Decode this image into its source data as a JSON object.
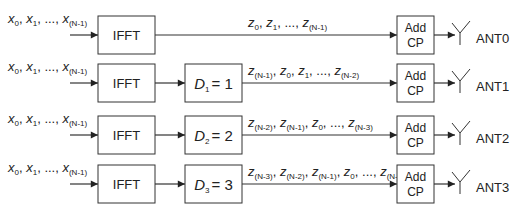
{
  "colors": {
    "line": "#333333",
    "box_fill": "#ffffff",
    "text": "#222222"
  },
  "rows": [
    {
      "input_label": "x0, x1, ..., x(N-1)",
      "ifft_label": "IFFT",
      "delay_label": null,
      "output_label": "z0, z1, ..., z(N-1)",
      "addcp_label_1": "Add",
      "addcp_label_2": "CP",
      "antenna_label": "ANT0"
    },
    {
      "input_label": "x0, x1, ..., x(N-1)",
      "ifft_label": "IFFT",
      "delay_label": "D1 = 1",
      "delay_var": "D",
      "delay_sub": "1",
      "delay_value": "= 1",
      "output_label": "z(N-1), z0, z1, ..., z(N-2)",
      "addcp_label_1": "Add",
      "addcp_label_2": "CP",
      "antenna_label": "ANT1"
    },
    {
      "input_label": "x0, x1, ..., x(N-1)",
      "ifft_label": "IFFT",
      "delay_label": "D2 = 2",
      "delay_var": "D",
      "delay_sub": "2",
      "delay_value": "= 2",
      "output_label": "z(N-2), z(N-1), z0, ..., z(N-3)",
      "addcp_label_1": "Add",
      "addcp_label_2": "CP",
      "antenna_label": "ANT2"
    },
    {
      "input_label": "x0, x1, ..., x(N-1)",
      "ifft_label": "IFFT",
      "delay_label": "D3 = 3",
      "delay_var": "D",
      "delay_sub": "3",
      "delay_value": "= 3",
      "output_label": "z(N-3), z(N-2), z(N-1), z0, ..., z(N-4)",
      "addcp_label_1": "Add",
      "addcp_label_2": "CP",
      "antenna_label": "ANT3"
    }
  ],
  "input_terms": [
    {
      "v": "x",
      "s": "0"
    },
    {
      "v": "x",
      "s": "1"
    },
    {
      "v": "...",
      "s": ""
    },
    {
      "v": "x",
      "s": "(N-1)"
    }
  ],
  "output_terms": [
    [
      {
        "v": "z",
        "s": "0"
      },
      {
        "v": "z",
        "s": "1"
      },
      {
        "v": "...",
        "s": ""
      },
      {
        "v": "z",
        "s": "(N-1)"
      }
    ],
    [
      {
        "v": "z",
        "s": "(N-1)"
      },
      {
        "v": "z",
        "s": "0"
      },
      {
        "v": "z",
        "s": "1"
      },
      {
        "v": "...",
        "s": ""
      },
      {
        "v": "z",
        "s": "(N-2)"
      }
    ],
    [
      {
        "v": "z",
        "s": "(N-2)"
      },
      {
        "v": "z",
        "s": "(N-1)"
      },
      {
        "v": "z",
        "s": "0"
      },
      {
        "v": "...",
        "s": ""
      },
      {
        "v": "z",
        "s": "(N-3)"
      }
    ],
    [
      {
        "v": "z",
        "s": "(N-3)"
      },
      {
        "v": "z",
        "s": "(N-2)"
      },
      {
        "v": "z",
        "s": "(N-1)"
      },
      {
        "v": "z",
        "s": "0"
      },
      {
        "v": "...",
        "s": ""
      },
      {
        "v": "z",
        "s": "(N-4)"
      }
    ]
  ]
}
